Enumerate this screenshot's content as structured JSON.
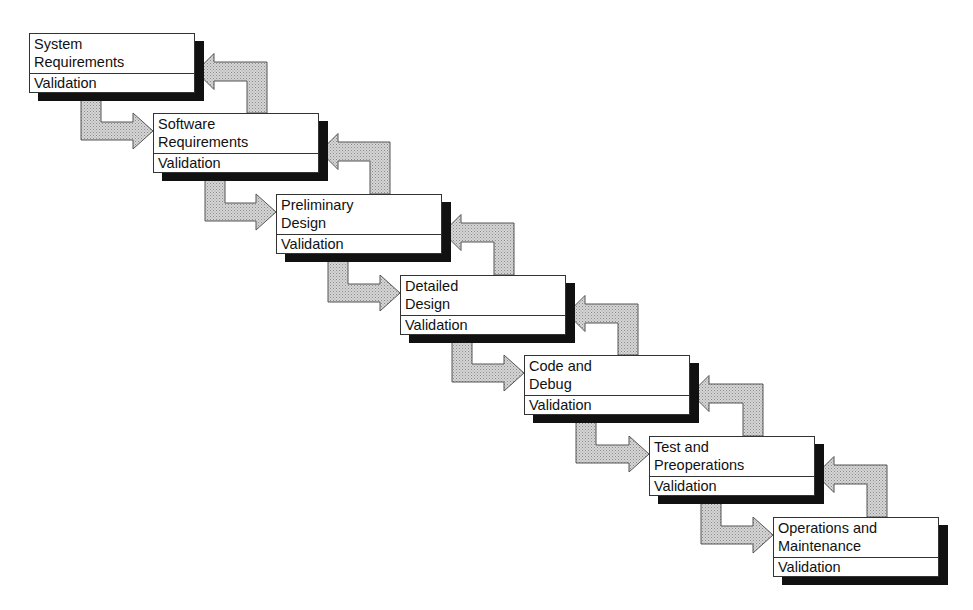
{
  "diagram": {
    "type": "waterfall-model",
    "stages": [
      {
        "title": "System\nRequirements",
        "validation": "Validation",
        "x": 29,
        "y": 33
      },
      {
        "title": "Software\nRequirements",
        "validation": "Validation",
        "x": 153,
        "y": 113
      },
      {
        "title": "Preliminary\nDesign",
        "validation": "Validation",
        "x": 276,
        "y": 194
      },
      {
        "title": "Detailed\nDesign",
        "validation": "Validation",
        "x": 400,
        "y": 275
      },
      {
        "title": "Code and\nDebug",
        "validation": "Validation",
        "x": 524,
        "y": 355
      },
      {
        "title": "Test and\nPreoperations",
        "validation": "Validation",
        "x": 649,
        "y": 436
      },
      {
        "title": "Operations and\nMaintenance",
        "validation": "Validation",
        "x": 773,
        "y": 517
      }
    ],
    "arrows": {
      "forward": "forward-arrow",
      "return": "feedback-arrow",
      "fill": "#c8c8c8",
      "stroke": "#555555"
    },
    "colors": {
      "background": "#ffffff",
      "box_fill": "#ffffff",
      "shadow": "#111111",
      "border": "#333333"
    }
  }
}
